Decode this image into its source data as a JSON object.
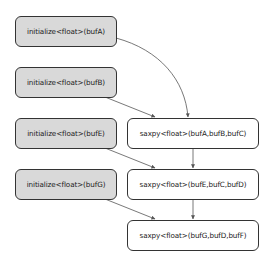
{
  "diagram": {
    "type": "task-dependency-graph",
    "colors": {
      "init_fill": "#d9d9d9",
      "kernel_fill": "#ffffff",
      "border": "#333333",
      "edge": "#555555"
    },
    "nodes": [
      {
        "id": "initA",
        "label": "initialize<float>(bufA)",
        "kind": "init"
      },
      {
        "id": "initB",
        "label": "initialize<float>(bufB)",
        "kind": "init"
      },
      {
        "id": "initE",
        "label": "initialize<float>(bufE)",
        "kind": "init"
      },
      {
        "id": "initG",
        "label": "initialize<float>(bufG)",
        "kind": "init"
      },
      {
        "id": "saxpy1",
        "label": "saxpy<float>(bufA,bufB,bufC)",
        "kind": "kernel"
      },
      {
        "id": "saxpy2",
        "label": "saxpy<float>(bufE,bufC,bufD)",
        "kind": "kernel"
      },
      {
        "id": "saxpy3",
        "label": "saxpy<float>(bufG,bufD,bufF)",
        "kind": "kernel"
      }
    ],
    "edges": [
      {
        "from": "initA",
        "to": "saxpy1"
      },
      {
        "from": "initB",
        "to": "saxpy1"
      },
      {
        "from": "initE",
        "to": "saxpy2"
      },
      {
        "from": "saxpy1",
        "to": "saxpy2"
      },
      {
        "from": "initG",
        "to": "saxpy3"
      },
      {
        "from": "saxpy2",
        "to": "saxpy3"
      }
    ]
  }
}
